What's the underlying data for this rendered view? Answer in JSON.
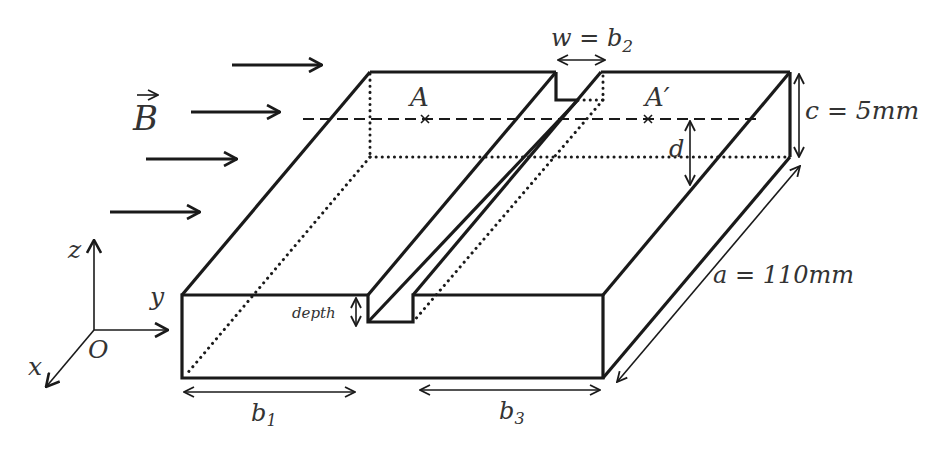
{
  "figure": {
    "type": "3D isometric sketch of a rectangular plate with a longitudinal groove in a magnetic field",
    "colors": {
      "line": "#1a1a1a",
      "text": "#333333",
      "background": "#ffffff"
    }
  },
  "labels": {
    "field": "B",
    "field_vector_arrow": "→",
    "point_a": "A",
    "point_a_prime": "A′",
    "groove_width": "w = b",
    "groove_width_sub": "2",
    "thickness": "c = 5mm",
    "length": "a = 110mm",
    "depth_param": "d",
    "groove_depth": "depth",
    "width_left": "b",
    "width_left_sub": "1",
    "width_right": "b",
    "width_right_sub": "3"
  },
  "axes": {
    "z": "z",
    "y": "y",
    "x": "x",
    "origin": "O"
  },
  "field_arrows": 4
}
